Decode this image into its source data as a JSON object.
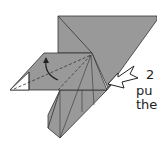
{
  "diagram": {
    "type": "origami-fold-step",
    "step_number": "2",
    "instruction_line1": "pu",
    "instruction_line2": "the",
    "colors": {
      "paper": "#999999",
      "edge": "#333333",
      "white": "#ffffff"
    }
  }
}
